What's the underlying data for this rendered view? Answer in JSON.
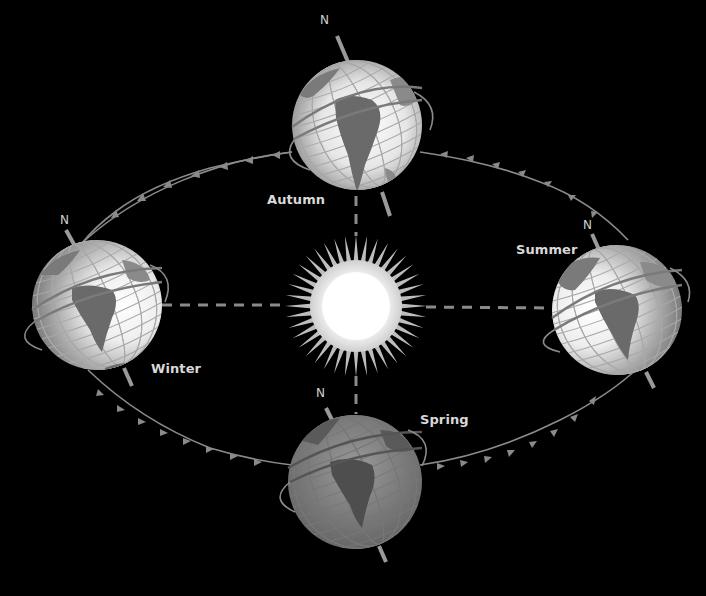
{
  "diagram": {
    "type": "earth-orbit-seasons",
    "background": "#000000",
    "orbit_color": "#8a8a8a",
    "sun": {
      "label": "",
      "center": [
        356,
        306
      ]
    },
    "seasons": [
      {
        "id": "autumn",
        "label": "Autumn",
        "north_label": "N",
        "shade": "bright"
      },
      {
        "id": "winter",
        "label": "Winter",
        "north_label": "N",
        "shade": "bright"
      },
      {
        "id": "summer",
        "label": "Summer",
        "north_label": "N",
        "shade": "bright"
      },
      {
        "id": "spring",
        "label": "Spring",
        "north_label": "N",
        "shade": "dark"
      }
    ]
  }
}
